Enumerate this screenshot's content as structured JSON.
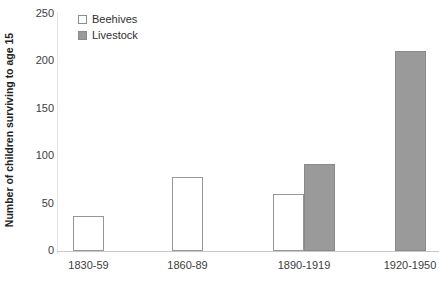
{
  "chart_data": {
    "type": "bar",
    "title": "",
    "xlabel": "",
    "ylabel": "Number of children surviving to age 15",
    "categories": [
      "1830-59",
      "1860-89",
      "1890-1919",
      "1920-1950"
    ],
    "series": [
      {
        "name": "Beehives",
        "color": "#ffffff",
        "values": [
          37,
          78,
          60,
          null
        ]
      },
      {
        "name": "Livestock",
        "color": "#9a9a9a",
        "values": [
          null,
          null,
          92,
          211
        ]
      }
    ],
    "ylim": [
      0,
      250
    ],
    "yticks": [
      0,
      50,
      100,
      150,
      200,
      250
    ],
    "ytick_labels": [
      "0",
      "50",
      "100",
      "150",
      "200",
      "250"
    ],
    "grid": false,
    "legend_position": "top-left"
  },
  "legend": {
    "items": [
      {
        "label": "Beehives",
        "swatch": "open-square-swatch"
      },
      {
        "label": "Livestock",
        "swatch": "filled-square-swatch"
      }
    ]
  },
  "axes": {
    "y_title": "Number of children surviving to age 15"
  }
}
